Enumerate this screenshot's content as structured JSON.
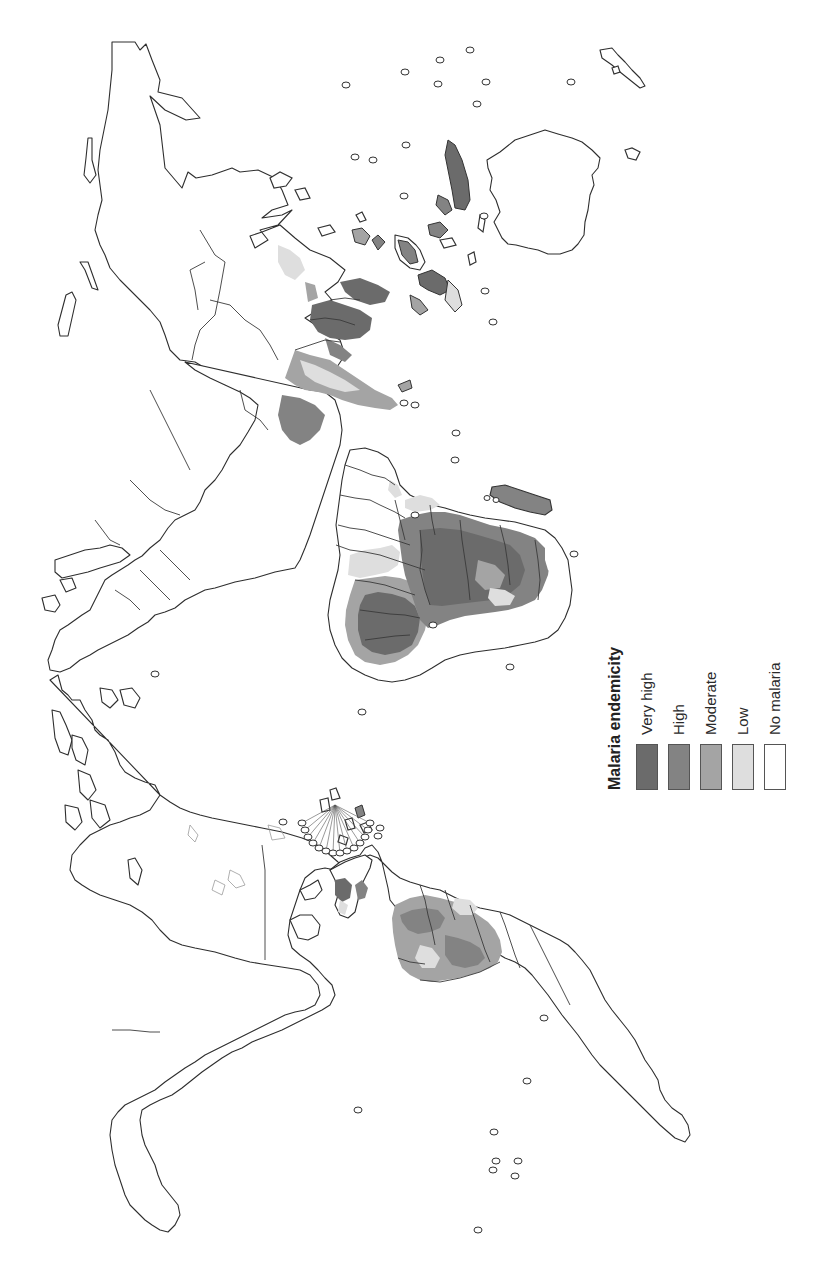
{
  "figure": {
    "orientation": "rotated 90° clockwise (north points right)",
    "caption_fragment": ""
  },
  "legend": {
    "title": "Malaria endemicity",
    "items": [
      {
        "label": "Very high",
        "color": "#6b6b6b"
      },
      {
        "label": "High",
        "color": "#838383"
      },
      {
        "label": "Moderate",
        "color": "#a4a4a4"
      },
      {
        "label": "Low",
        "color": "#dedede"
      },
      {
        "label": "No malaria",
        "color": "#ffffff"
      }
    ]
  },
  "map": {
    "subject": "World map of malaria endemicity",
    "regions_shaded": [
      "Sub-Saharan Africa",
      "Madagascar",
      "India",
      "Southeast Asia",
      "Indonesia",
      "Papua New Guinea",
      "Amazon basin",
      "Central America",
      "Caribbean"
    ],
    "colors": {
      "very_high": "#6b6b6b",
      "high": "#838383",
      "moderate": "#a4a4a4",
      "low": "#dedede",
      "none": "#ffffff",
      "outline": "#2e2e2e"
    }
  }
}
